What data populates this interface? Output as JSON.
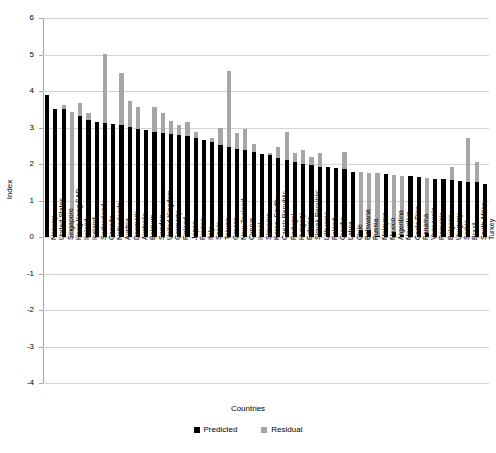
{
  "chart_data": {
    "type": "bar",
    "title": "",
    "subtitle": "",
    "xlabel": "Countries",
    "ylabel": "Index",
    "ylim": [
      -4,
      6
    ],
    "ytick_values": [
      6,
      5,
      4,
      3,
      2,
      1,
      0,
      -1,
      -2,
      -3,
      -4
    ],
    "ytick_labels": [
      "6",
      "5",
      "4",
      "3",
      "2",
      "1",
      "0",
      "-1",
      "-2",
      "-3",
      "-4"
    ],
    "grid": true,
    "legend_position": "bottom",
    "stacked": false,
    "colors": {
      "predicted": "#000000",
      "residual": "#a6a6a6",
      "gridline": "#d3d3d3",
      "axis": "#a6a6a6",
      "background": "#ffffff"
    },
    "legend": [
      {
        "name": "Predicted",
        "color": "#000000"
      },
      {
        "name": "Residual",
        "color": "#a6a6a6"
      }
    ],
    "categories": [
      "Norway",
      "United States",
      "Singapore",
      "Hong Kong SAR",
      "Ireland",
      "Iceland",
      "Switzerland",
      "Canada",
      "Netherlands",
      "Austria",
      "Denmark",
      "Australia",
      "Belgium",
      "Sweden",
      "United Kingdom",
      "Germany",
      "Finland",
      "Japan",
      "France",
      "Italy",
      "Spain",
      "Taiwan",
      "Greece",
      "New Zealand",
      "Cyprus",
      "Israel",
      "Slovenia",
      "Korea, South",
      "Czech Republic",
      "Portugal",
      "Hungary",
      "Estonia",
      "Slovak Republic",
      "Lithuania",
      "Poland",
      "Croatia",
      "Latvia",
      "Chile",
      "Botswana",
      "Russia",
      "Malaysia",
      "Mexico",
      "Argentina",
      "Mauritius",
      "Costa Rica",
      "Panama",
      "Venezuela",
      "Romania",
      "Bulgaria",
      "Uruguay",
      "Serbia",
      "Brazil",
      "South Africa",
      "Turkey"
    ],
    "series": [
      {
        "name": "Predicted",
        "color": "#000000",
        "values": [
          3.88,
          3.51,
          3.5,
          3.42,
          3.31,
          3.21,
          3.14,
          3.11,
          3.09,
          3.07,
          3.02,
          2.95,
          2.92,
          2.89,
          2.86,
          2.83,
          2.8,
          2.76,
          2.71,
          2.65,
          2.59,
          2.52,
          2.47,
          2.42,
          2.38,
          2.33,
          2.28,
          2.24,
          2.17,
          2.1,
          2.05,
          2.0,
          1.96,
          1.93,
          1.91,
          1.88,
          1.85,
          1.79,
          1.77,
          1.75,
          1.74,
          1.72,
          1.7,
          1.68,
          1.66,
          1.64,
          1.62,
          1.6,
          1.58,
          1.56,
          1.54,
          1.52,
          1.5,
          1.45
        ]
      },
      {
        "name": "Residual",
        "color": "#a6a6a6",
        "values": [
          0.0,
          0.0,
          0.13,
          -3.42,
          0.36,
          0.18,
          0.0,
          1.91,
          0.0,
          1.43,
          0.7,
          0.62,
          0.0,
          0.68,
          0.55,
          0.36,
          0.26,
          0.4,
          0.16,
          0.0,
          0.12,
          0.48,
          2.08,
          0.43,
          0.58,
          0.21,
          0.0,
          0.06,
          0.3,
          0.78,
          0.26,
          0.37,
          0.23,
          0.38,
          0.0,
          0.0,
          0.48,
          0.0,
          -1.58,
          -1.56,
          -1.71,
          0.0,
          -1.56,
          -1.63,
          0.0,
          0.0,
          -1.52,
          0.0,
          0.0,
          0.36,
          0.0,
          1.18,
          0.55,
          0.0
        ]
      }
    ]
  }
}
